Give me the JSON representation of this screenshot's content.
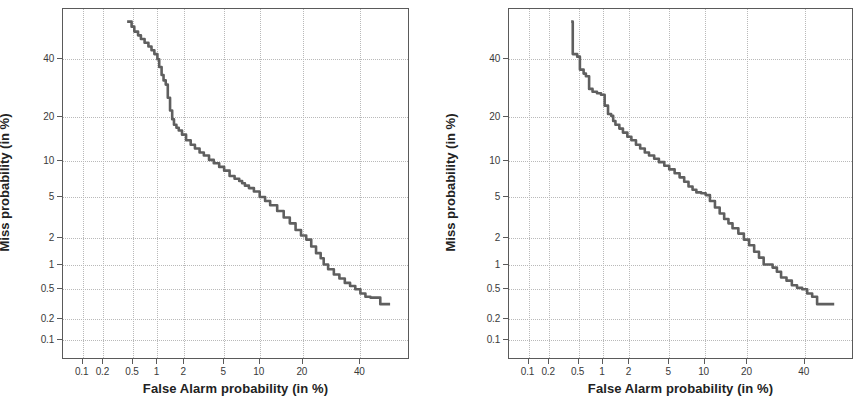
{
  "figure": {
    "title": "",
    "panel_count": 2
  },
  "chart_data": [
    {
      "id": "det-left",
      "type": "line",
      "title": "",
      "xlabel": "False Alarm probability (in %)",
      "ylabel": "Miss probability (in %)",
      "scale": "normal-deviate (DET)",
      "grid": true,
      "grid_style": "dotted",
      "legend": "none",
      "xticks": [
        0.1,
        0.2,
        0.5,
        1,
        2,
        5,
        10,
        20,
        40
      ],
      "xticklabels": [
        "0.1",
        "0.2",
        "0.5",
        "1",
        "2",
        "5",
        "10",
        "20",
        "40"
      ],
      "yticks": [
        40,
        20,
        10,
        5,
        2,
        1,
        0.5,
        0.2,
        0.1
      ],
      "yticklabels": [
        "40",
        "20",
        "10",
        "5",
        "2",
        "1",
        "0.5",
        "0.2",
        "0.1"
      ],
      "xlim": [
        0.05,
        60
      ],
      "ylim": [
        0.05,
        60
      ],
      "series": [
        {
          "name": "DET curve 1",
          "color": "#5f5f5f",
          "x": [
            0.42,
            0.48,
            0.52,
            0.58,
            0.63,
            0.7,
            0.78,
            0.85,
            0.92,
            1.0,
            1.05,
            1.12,
            1.18,
            1.25,
            1.32,
            1.4,
            1.48,
            1.55,
            1.65,
            1.75,
            1.9,
            2.1,
            2.35,
            2.6,
            2.9,
            3.2,
            3.6,
            4.0,
            4.5,
            5.0,
            5.6,
            6.2,
            6.8,
            7.2,
            7.6,
            8.2,
            9.0,
            10.0,
            11.0,
            12.0,
            13.5,
            15.0,
            16.5,
            18.0,
            19.5,
            21.0,
            22.5,
            24.0,
            25.5,
            26.5,
            28.0,
            30.0,
            32.0,
            34.0,
            36.0,
            38.0,
            40.0,
            42.0,
            44.0,
            46.0,
            48.0,
            52.0
          ],
          "y": [
            55.0,
            53.0,
            51.0,
            49.5,
            48.0,
            46.5,
            45.0,
            43.5,
            42.0,
            40.0,
            37.0,
            34.0,
            32.0,
            30.5,
            26.0,
            22.0,
            19.5,
            18.0,
            17.2,
            16.5,
            15.5,
            14.2,
            13.2,
            12.4,
            11.6,
            11.0,
            10.2,
            9.6,
            9.0,
            8.4,
            7.6,
            7.2,
            6.9,
            6.6,
            6.3,
            6.0,
            5.6,
            5.0,
            4.6,
            4.2,
            3.7,
            3.2,
            2.8,
            2.4,
            2.1,
            1.9,
            1.6,
            1.35,
            1.18,
            1.0,
            0.88,
            0.76,
            0.68,
            0.6,
            0.55,
            0.5,
            0.44,
            0.4,
            0.39,
            0.39,
            0.32,
            0.32
          ],
          "note": "monotone decreasing staircase DET curve"
        }
      ]
    },
    {
      "id": "det-right",
      "type": "line",
      "title": "",
      "xlabel": "False Alarm probability (in %)",
      "ylabel": "Miss probability (in %)",
      "scale": "normal-deviate (DET)",
      "grid": true,
      "grid_style": "dotted",
      "legend": "none",
      "xticks": [
        0.1,
        0.2,
        0.5,
        1,
        2,
        5,
        10,
        20,
        40
      ],
      "xticklabels": [
        "0.1",
        "0.2",
        "0.5",
        "1",
        "2",
        "5",
        "10",
        "20",
        "40"
      ],
      "yticks": [
        40,
        20,
        10,
        5,
        2,
        1,
        0.5,
        0.2,
        0.1
      ],
      "yticklabels": [
        "40",
        "20",
        "10",
        "5",
        "2",
        "1",
        "0.5",
        "0.2",
        "0.1"
      ],
      "xlim": [
        0.05,
        60
      ],
      "ylim": [
        0.05,
        60
      ],
      "series": [
        {
          "name": "DET curve 2",
          "color": "#5f5f5f",
          "x": [
            0.4,
            0.42,
            0.48,
            0.52,
            0.58,
            0.62,
            0.68,
            0.75,
            0.85,
            0.95,
            1.05,
            1.15,
            1.25,
            1.32,
            1.4,
            1.55,
            1.7,
            1.9,
            2.1,
            2.35,
            2.6,
            2.9,
            3.2,
            3.6,
            4.0,
            4.5,
            5.0,
            5.6,
            6.2,
            6.8,
            7.4,
            8.0,
            8.6,
            9.4,
            10.2,
            11.0,
            12.0,
            13.0,
            14.0,
            15.0,
            16.0,
            17.5,
            19.0,
            20.5,
            22.0,
            23.5,
            25.0,
            26.5,
            28.0,
            29.5,
            31.0,
            33.0,
            35.0,
            37.0,
            39.0,
            41.0,
            43.0,
            45.0,
            48.0,
            52.0
          ],
          "y": [
            55.0,
            42.0,
            41.0,
            36.0,
            34.5,
            33.5,
            29.0,
            28.0,
            27.5,
            27.0,
            23.5,
            21.0,
            20.5,
            19.0,
            18.0,
            17.0,
            16.0,
            15.0,
            14.2,
            13.2,
            12.4,
            11.6,
            11.0,
            10.4,
            9.8,
            9.2,
            8.6,
            8.0,
            7.4,
            6.8,
            6.2,
            5.8,
            5.5,
            5.4,
            5.2,
            4.6,
            4.0,
            3.5,
            3.1,
            2.8,
            2.5,
            2.2,
            1.9,
            1.65,
            1.4,
            1.2,
            1.0,
            1.0,
            0.92,
            0.82,
            0.7,
            0.64,
            0.56,
            0.52,
            0.5,
            0.44,
            0.4,
            0.32,
            0.32,
            0.32
          ],
          "note": "monotone decreasing staircase DET curve"
        }
      ]
    }
  ],
  "panels": [
    {
      "id": "left",
      "xlabel": "False Alarm probability (in %)",
      "ylabel": "Miss probability (in %)"
    },
    {
      "id": "right",
      "xlabel": "False Alarm probability (in %)",
      "ylabel": "Miss probability (in %)"
    }
  ],
  "colors": {
    "curve": "#5f5f5f",
    "grid": "#b9b9b9",
    "frame": "#5a5a5a",
    "text": "#2b2b2b",
    "background": "#ffffff"
  }
}
